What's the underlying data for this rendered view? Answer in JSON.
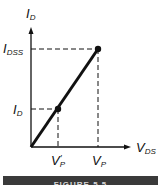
{
  "diagram": {
    "type": "id-vds-linear-region-plot",
    "y_axis_label": {
      "main": "I",
      "sub": "D"
    },
    "x_axis_label": {
      "main": "V",
      "sub": "DS"
    },
    "y_ticks": [
      {
        "main": "I",
        "sub": "DSS"
      },
      {
        "main": "I",
        "sub": "D"
      }
    ],
    "x_ticks": [
      {
        "main": "V",
        "sub": "P",
        "prime": "′"
      },
      {
        "main": "V",
        "sub": "P",
        "prime": ""
      }
    ],
    "points": [
      {
        "name": "pinch-off-point",
        "x_label": "V_P",
        "y_label": "I_DSS"
      },
      {
        "name": "operating-point",
        "x_label": "V_P'",
        "y_label": "I_D"
      }
    ],
    "colors": {
      "line": "#111111",
      "caption_bar": "#3a3a3a"
    }
  },
  "caption": {
    "text": "FIGURE 5.5"
  }
}
